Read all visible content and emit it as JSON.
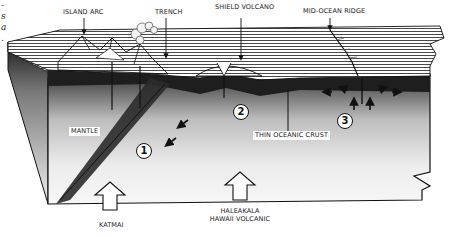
{
  "caption_fragments": [
    "-",
    "s",
    "a",
    "."
  ],
  "labels": {
    "island_arc": "ISLAND ARC",
    "trench": "TRENCH",
    "shield_volcano": "SHIELD VOLCANO",
    "mid_ocean_ridge": "MID-OCEAN RIDGE",
    "mantle": "MANTLE",
    "thin_oceanic_crust": "THIN OCEANIC CRUST"
  },
  "markers": [
    {
      "id": "1",
      "label": "1"
    },
    {
      "id": "2",
      "label": "2"
    },
    {
      "id": "3",
      "label": "3"
    }
  ],
  "bottom_arrows": {
    "katmai": "KATMAI",
    "haleakala_line1": "HALEAKALA",
    "haleakala_line2": "HAWAII VOLCANIC"
  },
  "colors": {
    "ink": "#111111",
    "crust_dark": "#1e1e1e",
    "mantle_light": "#f4f4f4",
    "background": "#ffffff"
  }
}
